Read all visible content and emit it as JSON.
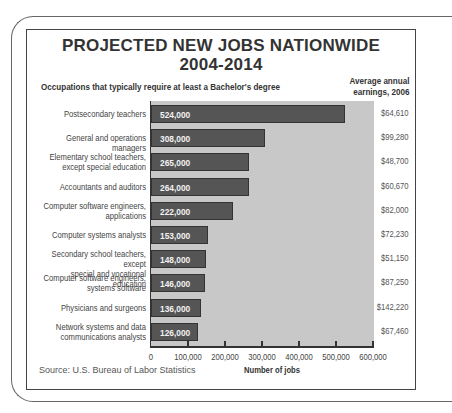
{
  "chart_data": {
    "type": "bar",
    "orientation": "horizontal",
    "title": "PROJECTED NEW JOBS NATIONWIDE",
    "subtitle_year": "2004-2014",
    "category_header": "Occupations that typically require at least a Bachelor's degree",
    "secondary_header": "Average annual earnings, 2006",
    "categories": [
      "Postsecondary teachers",
      "General and operations managers",
      "Elementary school teachers, except special education",
      "Accountants and auditors",
      "Computer software engineers, applications",
      "Computer systems analysts",
      "Secondary school teachers, except special and vocational education",
      "Computer software engineers, systems software",
      "Physicians and surgeons",
      "Network systems and data communications analysts"
    ],
    "values": [
      524000,
      308000,
      265000,
      264000,
      222000,
      153000,
      148000,
      146000,
      136000,
      126000
    ],
    "value_labels": [
      "524,000",
      "308,000",
      "265,000",
      "264,000",
      "222,000",
      "153,000",
      "148,000",
      "146,000",
      "136,000",
      "126,000"
    ],
    "earnings": [
      "$64,610",
      "$99,280",
      "$48,700",
      "$60,670",
      "$82,000",
      "$72,230",
      "$51,150",
      "$87,250",
      "$142,220",
      "$67,460"
    ],
    "xlabel": "Number of jobs",
    "ylabel": "",
    "xlim": [
      0,
      600000
    ],
    "xticks": [
      "0",
      "100,000",
      "200,000",
      "300,000",
      "400,000",
      "500,000",
      "600,000"
    ],
    "grid": false,
    "source": "Source: U.S. Bureau of Labor Statistics",
    "colors": {
      "bar": "#555555",
      "plot_bg": "#c8c8c8"
    }
  },
  "title_line1": "PROJECTED NEW JOBS NATIONWIDE",
  "title_line2": "2004-2014",
  "subtitle": "Occupations that typically require at least a Bachelor's degree",
  "earnings_header_1": "Average annual",
  "earnings_header_2": "earnings, 2006",
  "rows": [
    {
      "l1": "Postsecondary teachers",
      "l2": "",
      "val": "524,000",
      "earn": "$64,610"
    },
    {
      "l1": "General and operations managers",
      "l2": "",
      "val": "308,000",
      "earn": "$99,280"
    },
    {
      "l1": "Elementary school teachers,",
      "l2": "except special education",
      "val": "265,000",
      "earn": "$48,700"
    },
    {
      "l1": "Accountants and auditors",
      "l2": "",
      "val": "264,000",
      "earn": "$60,670"
    },
    {
      "l1": "Computer software engineers,",
      "l2": "applications",
      "val": "222,000",
      "earn": "$82,000"
    },
    {
      "l1": "Computer systems analysts",
      "l2": "",
      "val": "153,000",
      "earn": "$72,230"
    },
    {
      "l1": "Secondary school teachers, except",
      "l2": "special and vocational education",
      "val": "148,000",
      "earn": "$51,150"
    },
    {
      "l1": "Computer software engineers,",
      "l2": "systems software",
      "val": "146,000",
      "earn": "$87,250"
    },
    {
      "l1": "Physicians and surgeons",
      "l2": "",
      "val": "136,000",
      "earn": "$142,220"
    },
    {
      "l1": "Network systems and data",
      "l2": "communications analysts",
      "val": "126,000",
      "earn": "$67,460"
    }
  ],
  "xticks": [
    "0",
    "100,000",
    "200,000",
    "300,000",
    "400,000",
    "500,000",
    "600,000"
  ],
  "xlabel": "Number of jobs",
  "source": "Source: U.S. Bureau of Labor Statistics"
}
